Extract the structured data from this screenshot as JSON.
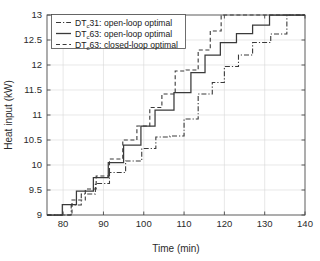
{
  "chart_data": {
    "type": "line",
    "title": "",
    "xlabel": "Time (min)",
    "ylabel": "Heat input (kW)",
    "xlim": [
      76,
      140
    ],
    "ylim": [
      9,
      13
    ],
    "xticks": [
      80,
      90,
      100,
      110,
      120,
      130,
      140
    ],
    "yticks": [
      9,
      9.5,
      10,
      10.5,
      11,
      11.5,
      12,
      12.5,
      13
    ],
    "xtick_labels": [
      "80",
      "90",
      "100",
      "110",
      "120",
      "130",
      "140"
    ],
    "ytick_labels": [
      "9",
      "9.5",
      "10",
      "10.5",
      "11",
      "11.5",
      "12",
      "12.5",
      "13"
    ],
    "grid": true,
    "legend_position": "upper-left",
    "line_color": "#3a3a3a",
    "grid_color": "#d8d8d8",
    "axis_color": "#4a4a4a",
    "drawstyle": "steps-post",
    "series": [
      {
        "name": "DT_c31: open-loop optimal",
        "label_prefix": "DT",
        "label_sub": "c",
        "label_rest": "31: open-loop optimal",
        "linestyle": "dashdot",
        "x": [
          76.0,
          82.0,
          84.5,
          88.0,
          91.5,
          95.5,
          99.5,
          103.0,
          106.5,
          110.0,
          113.5,
          117.0,
          120.0,
          123.5,
          127.0,
          131.5,
          135.5,
          140.0
        ],
        "y": [
          9.0,
          9.2,
          9.42,
          9.63,
          9.85,
          10.08,
          10.33,
          10.56,
          10.58,
          10.92,
          11.42,
          11.65,
          11.97,
          12.2,
          12.45,
          12.62,
          13.0,
          13.0
        ]
      },
      {
        "name": "DT_c63: open-loop optimal",
        "label_prefix": "DT",
        "label_sub": "c",
        "label_rest": "63: open-loop optimal",
        "linestyle": "solid",
        "x": [
          76.0,
          79.8,
          83.3,
          87.5,
          91.2,
          95.0,
          99.3,
          102.8,
          107.5,
          111.7,
          115.2,
          119.0,
          123.0,
          127.0,
          131.2,
          135.5,
          140.0
        ],
        "y": [
          9.0,
          9.21,
          9.48,
          9.75,
          10.05,
          10.4,
          10.78,
          11.1,
          11.45,
          11.85,
          12.2,
          12.45,
          12.63,
          12.8,
          13.0,
          13.0,
          13.0
        ]
      },
      {
        "name": "DT_c63: closed-loop optimal",
        "label_prefix": "DT",
        "label_sub": "c",
        "label_rest": "63: closed-loop optimal",
        "linestyle": "dashed",
        "x": [
          76.0,
          82.2,
          85.5,
          88.2,
          91.5,
          94.8,
          98.3,
          101.5,
          104.5,
          107.8,
          110.5,
          113.5,
          116.5,
          119.2,
          123.0,
          140.0
        ],
        "y": [
          9.0,
          9.3,
          9.52,
          9.78,
          10.12,
          10.5,
          10.78,
          11.15,
          11.42,
          11.88,
          11.9,
          12.3,
          12.68,
          13.0,
          13.0,
          13.0
        ]
      }
    ]
  },
  "legend": {
    "entries": [
      {
        "label": "DT",
        "sub": "c",
        "rest": "31: open-loop optimal",
        "style": "dashdot"
      },
      {
        "label": "DT",
        "sub": "c",
        "rest": "63: open-loop optimal",
        "style": "solid"
      },
      {
        "label": "DT",
        "sub": "c",
        "rest": "63: closed-loop optimal",
        "style": "dashed"
      }
    ]
  }
}
